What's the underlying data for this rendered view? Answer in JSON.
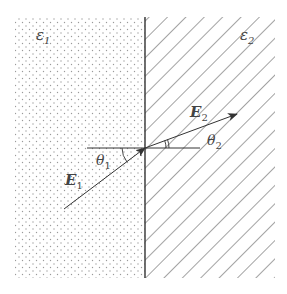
{
  "diagram": {
    "type": "refraction-at-dielectric-interface",
    "media": [
      {
        "id": "medium-1",
        "label": "ε",
        "subscript": "1",
        "fill": "dotted"
      },
      {
        "id": "medium-2",
        "label": "ε",
        "subscript": "2",
        "fill": "hatched"
      }
    ],
    "vectors": [
      {
        "id": "E1",
        "label": "E",
        "subscript": "1"
      },
      {
        "id": "E2",
        "label": "E",
        "subscript": "2"
      }
    ],
    "angles": [
      {
        "id": "theta1",
        "label": "θ",
        "subscript": "1"
      },
      {
        "id": "theta2",
        "label": "θ",
        "subscript": "2"
      }
    ],
    "colors": {
      "line": "#333333",
      "dots": "#9a9a9a",
      "hatch": "#555555",
      "text": "#444444"
    }
  }
}
